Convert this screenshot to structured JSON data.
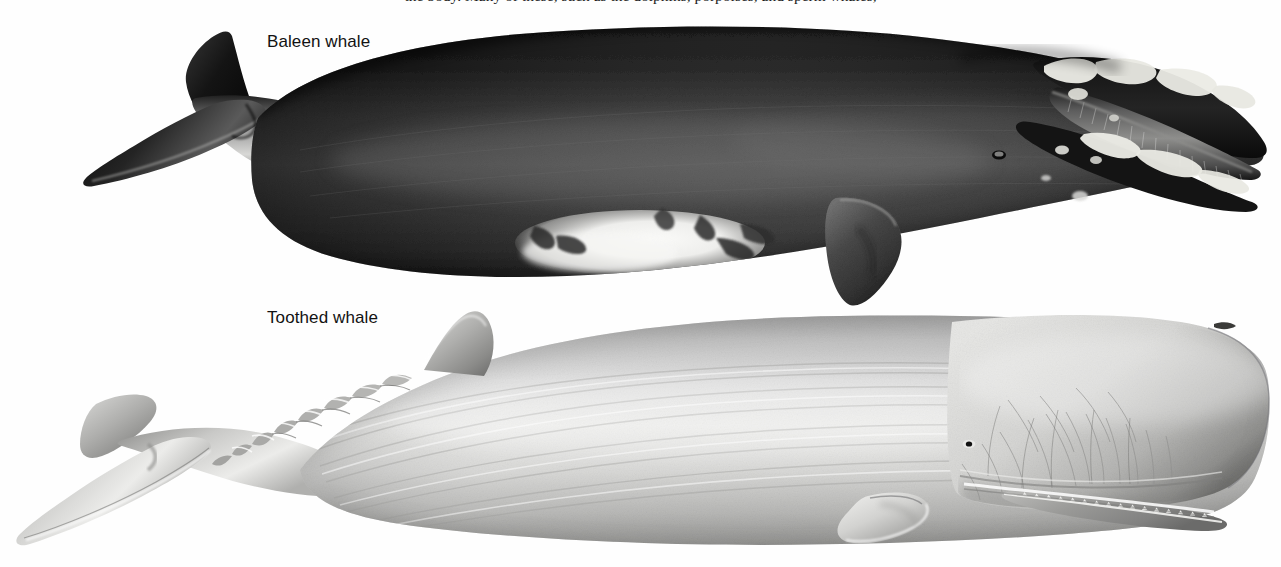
{
  "page": {
    "width": 1281,
    "height": 567,
    "background_color": "#fefefe",
    "kind": "scientific-illustration"
  },
  "caption": {
    "partial_top_line": "the body. Many of these, such as the dolphins, porpoises, and sperm whales,",
    "visible": "clipped-descenders-only"
  },
  "labels": {
    "baleen": "Baleen whale",
    "toothed": "Toothed whale"
  },
  "figures": [
    {
      "id": "baleen-whale",
      "label": "Baleen whale",
      "common_identification": "bowhead / right whale",
      "orientation": "head-right, tail-left",
      "body_tone": "#2b2b2b",
      "belly_patch_tone": "#f2f2f0",
      "features": [
        "paired tail flukes",
        "no dorsal fin",
        "arched upper jaw with baleen plates",
        "pale callosities on rostrum and lower lip",
        "paddle-shaped pectoral flipper",
        "white chin and belly patch",
        "small eye above the gape"
      ]
    },
    {
      "id": "toothed-whale",
      "label": "Toothed whale",
      "common_identification": "sperm whale",
      "orientation": "head-right, tail-left",
      "body_tone": "#cfcfcf",
      "features": [
        "huge blunt square head",
        "single blowhole at front left of head",
        "narrow lower jaw lined with conical teeth",
        "dorsal hump followed by a row of knuckles",
        "wrinkled skin along the flank",
        "small paddle flipper",
        "broad triangular flukes"
      ]
    }
  ],
  "colors": {
    "page_background": "#fefefe",
    "label_text": "#121212",
    "baleen_dark": "#1f1f1f",
    "baleen_mid": "#3a3a3a",
    "baleen_light": "#6e6e6e",
    "belly_white": "#f4f4f2",
    "toothed_dark": "#8e8e8e",
    "toothed_mid": "#b9b9b9",
    "toothed_light": "#e3e3e1",
    "callosity": "#efefe9"
  }
}
